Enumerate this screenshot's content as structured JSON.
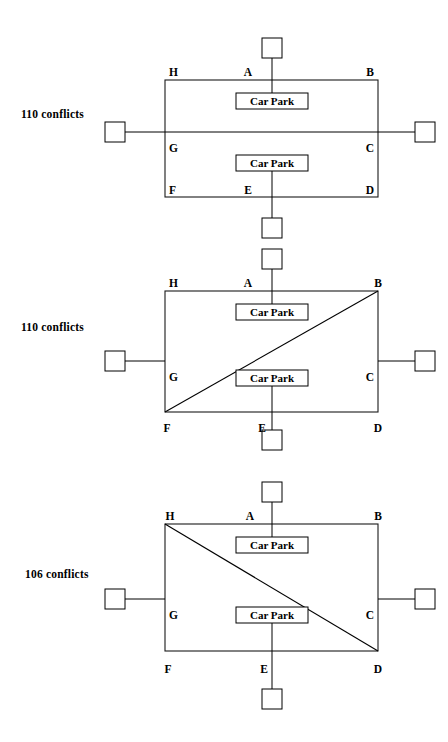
{
  "page": {
    "width": 448,
    "height": 742,
    "background": "#ffffff",
    "ink": "#000000"
  },
  "labels": {
    "car_park": "Car Park"
  },
  "diagrams": [
    {
      "id": "layout-1",
      "conflicts_label": "110 conflicts",
      "conflicts_value": 110,
      "variant": "horizontal-through-road",
      "nodes": [
        {
          "id": "A",
          "label": "A",
          "position": "top-middle"
        },
        {
          "id": "B",
          "label": "B",
          "position": "top-right"
        },
        {
          "id": "C",
          "label": "C",
          "position": "right-middle"
        },
        {
          "id": "D",
          "label": "D",
          "position": "bottom-right"
        },
        {
          "id": "E",
          "label": "E",
          "position": "bottom-middle"
        },
        {
          "id": "F",
          "label": "F",
          "position": "bottom-left"
        },
        {
          "id": "G",
          "label": "G",
          "position": "left-middle"
        },
        {
          "id": "H",
          "label": "H",
          "position": "top-left"
        }
      ],
      "car_parks": [
        {
          "id": "cp-top",
          "label": "Car Park",
          "connects_to": "A"
        },
        {
          "id": "cp-bottom",
          "label": "Car Park",
          "connects_to": "E"
        }
      ],
      "terminals": [
        {
          "id": "term-top",
          "attaches_to": "A"
        },
        {
          "id": "term-left",
          "attaches_to": "G"
        },
        {
          "id": "term-right",
          "attaches_to": "C"
        },
        {
          "id": "term-bottom",
          "attaches_to": "E"
        }
      ],
      "internal_links": [
        {
          "from": "G",
          "to": "C",
          "kind": "straight"
        }
      ]
    },
    {
      "id": "layout-2",
      "conflicts_label": "110 conflicts",
      "conflicts_value": 110,
      "variant": "diagonal-F-to-B",
      "nodes": [
        {
          "id": "A",
          "label": "A",
          "position": "top-middle"
        },
        {
          "id": "B",
          "label": "B",
          "position": "top-right"
        },
        {
          "id": "C",
          "label": "C",
          "position": "right-middle"
        },
        {
          "id": "D",
          "label": "D",
          "position": "bottom-right"
        },
        {
          "id": "E",
          "label": "E",
          "position": "bottom-middle"
        },
        {
          "id": "F",
          "label": "F",
          "position": "bottom-left"
        },
        {
          "id": "G",
          "label": "G",
          "position": "left-middle"
        },
        {
          "id": "H",
          "label": "H",
          "position": "top-left"
        }
      ],
      "car_parks": [
        {
          "id": "cp-top",
          "label": "Car Park",
          "connects_to": "A"
        },
        {
          "id": "cp-bottom",
          "label": "Car Park",
          "connects_to": "E"
        }
      ],
      "terminals": [
        {
          "id": "term-top",
          "attaches_to": "A"
        },
        {
          "id": "term-left",
          "attaches_to": "G"
        },
        {
          "id": "term-right",
          "attaches_to": "C"
        },
        {
          "id": "term-bottom",
          "attaches_to": "E"
        }
      ],
      "internal_links": [
        {
          "from": "F",
          "to": "B",
          "kind": "diagonal"
        }
      ]
    },
    {
      "id": "layout-3",
      "conflicts_label": "106 conflicts",
      "conflicts_value": 106,
      "variant": "diagonal-H-to-D",
      "nodes": [
        {
          "id": "A",
          "label": "A",
          "position": "top-middle"
        },
        {
          "id": "B",
          "label": "B",
          "position": "top-right"
        },
        {
          "id": "C",
          "label": "C",
          "position": "right-middle"
        },
        {
          "id": "D",
          "label": "D",
          "position": "bottom-right"
        },
        {
          "id": "E",
          "label": "E",
          "position": "bottom-middle"
        },
        {
          "id": "F",
          "label": "F",
          "position": "bottom-left"
        },
        {
          "id": "G",
          "label": "G",
          "position": "left-middle"
        },
        {
          "id": "H",
          "label": "H",
          "position": "top-left"
        }
      ],
      "car_parks": [
        {
          "id": "cp-top",
          "label": "Car Park",
          "connects_to": "A"
        },
        {
          "id": "cp-bottom",
          "label": "Car Park",
          "connects_to": "E"
        }
      ],
      "terminals": [
        {
          "id": "term-top",
          "attaches_to": "A"
        },
        {
          "id": "term-left",
          "attaches_to": "G"
        },
        {
          "id": "term-right",
          "attaches_to": "C"
        },
        {
          "id": "term-bottom",
          "attaches_to": "E"
        }
      ],
      "internal_links": [
        {
          "from": "H",
          "to": "D",
          "kind": "diagonal"
        }
      ]
    }
  ]
}
